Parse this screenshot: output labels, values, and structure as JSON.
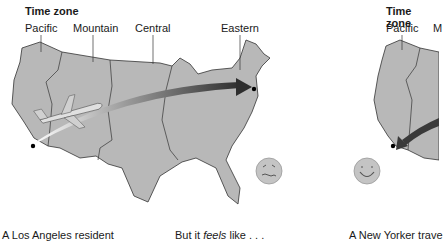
{
  "left_panel": {
    "title": "Time zone",
    "zones": [
      "Pacific",
      "Mountain",
      "Central",
      "Eastern"
    ],
    "origin_city": "Los Angeles",
    "destination_city": "New York",
    "arrow_direction": "west-to-east",
    "face": "queasy-face",
    "caption": "A Los Angeles resident",
    "caption2_prefix": "But it ",
    "caption2_emph": "feels",
    "caption2_suffix": " like . . ."
  },
  "right_panel": {
    "title": "Time zone",
    "zones": [
      "Pacific",
      "M"
    ],
    "arrow_direction": "east-to-west",
    "face": "smiley-face",
    "caption": "A New Yorker trave"
  },
  "colors": {
    "map_fill": "#b8b8b8",
    "map_border": "#333333",
    "arrow_dark": "#3a3a3a",
    "arrow_light": "#ffffff",
    "face_fill": "#c4c4c4"
  }
}
